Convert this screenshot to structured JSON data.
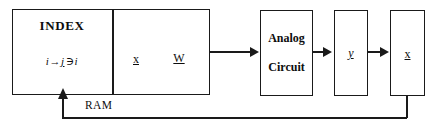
{
  "diagram": {
    "stroke_color": "#1a1a1a",
    "background_color": "#ffffff",
    "blocks": {
      "index": {
        "title": "INDEX",
        "formula_from": "i",
        "formula_arrow": "→",
        "formula_to": "j",
        "formula_relation": "∋",
        "formula_end": "i",
        "formula_full": "i → j ∋ i"
      },
      "memory": {
        "vector_x": "x",
        "matrix_w": "W"
      },
      "analog_circuit": {
        "line1": "Analog",
        "line2": "Circuit"
      },
      "output_y": {
        "vector_y": "y"
      },
      "output_x": {
        "vector_x": "x"
      }
    },
    "labels": {
      "ram": "RAM"
    },
    "connectors": {
      "ram_to_analog": "→",
      "analog_to_y": "→",
      "y_to_x": "→",
      "feedback_to_index": "↑"
    }
  }
}
